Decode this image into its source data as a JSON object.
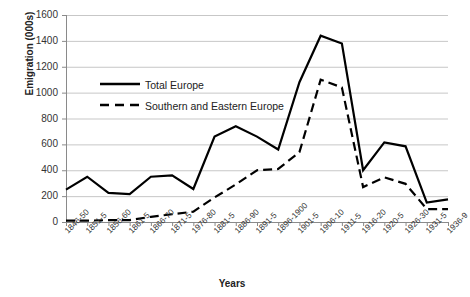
{
  "chart_data": {
    "type": "line",
    "title": "",
    "xlabel": "Years",
    "ylabel": "Emigration (000s)",
    "ylim": [
      0,
      1600
    ],
    "ytick_values": [
      0,
      200,
      400,
      600,
      800,
      1000,
      1200,
      1400,
      1600
    ],
    "ytick_labels": [
      "0",
      "200",
      "400",
      "600",
      "800",
      "1000",
      "1200",
      "1400",
      "1600"
    ],
    "grid": true,
    "legend_position": "upper-left-inside",
    "categories": [
      "1846-50",
      "1851-5",
      "1856-60",
      "1861-5",
      "1866-70",
      "1871-5",
      "1976-80",
      "1881-5",
      "1886-90",
      "1891-5",
      "1896-1900",
      "1901-5",
      "1906-10",
      "1911-5",
      "1916-20",
      "1920-5",
      "1926-30",
      "1931-5",
      "1936-9"
    ],
    "series": [
      {
        "name": "Total Europe",
        "style": "solid",
        "color": "#000000",
        "values": [
          250,
          350,
          225,
          215,
          350,
          360,
          255,
          660,
          740,
          660,
          560,
          1080,
          1440,
          1380,
          400,
          615,
          585,
          150,
          175
        ]
      },
      {
        "name": "Southern and Eastern Europe",
        "style": "dashed",
        "color": "#000000",
        "values": [
          10,
          10,
          15,
          15,
          40,
          60,
          80,
          190,
          290,
          400,
          410,
          540,
          1100,
          1040,
          270,
          345,
          295,
          100,
          100
        ]
      }
    ]
  },
  "legend": {
    "items": [
      {
        "label": "Total Europe"
      },
      {
        "label": "Southern and Eastern Europe"
      }
    ]
  }
}
